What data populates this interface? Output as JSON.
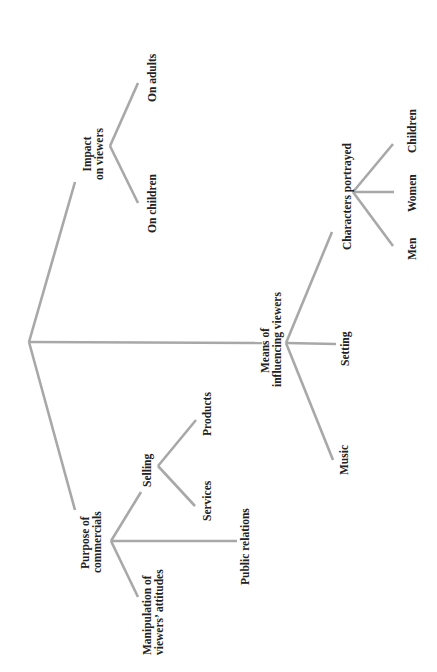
{
  "diagram": {
    "type": "tree",
    "orientation": "rotated-90-counterclockwise",
    "line_color": "#a8a8a8",
    "text_color": "#222222",
    "root": {
      "label": "",
      "children": [
        {
          "id": "impact",
          "label_lines": [
            "Impact",
            "on viewers"
          ],
          "children": [
            {
              "id": "on_children",
              "label": "On children"
            },
            {
              "id": "on_adults",
              "label": "On adults"
            }
          ]
        },
        {
          "id": "means",
          "label_lines": [
            "Means of",
            "influencing viewers"
          ],
          "children": [
            {
              "id": "music",
              "label": "Music"
            },
            {
              "id": "setting",
              "label": "Setting"
            },
            {
              "id": "characters",
              "label": "Characters portrayed",
              "children": [
                {
                  "id": "men",
                  "label": "Men"
                },
                {
                  "id": "women",
                  "label": "Women"
                },
                {
                  "id": "children",
                  "label": "Children"
                }
              ]
            }
          ]
        },
        {
          "id": "purpose",
          "label_lines": [
            "Purpose of",
            "commercials"
          ],
          "children": [
            {
              "id": "manipulation",
              "label_lines": [
                "Manipulation of",
                "viewers' attitudes"
              ]
            },
            {
              "id": "public_relations",
              "label": "Public relations"
            },
            {
              "id": "selling",
              "label": "Selling",
              "children": [
                {
                  "id": "services",
                  "label": "Services"
                },
                {
                  "id": "products",
                  "label": "Products"
                }
              ]
            }
          ]
        }
      ]
    }
  },
  "labels": {
    "impact": [
      "Impact",
      "on viewers"
    ],
    "on_children": "On children",
    "on_adults": "On adults",
    "means": [
      "Means of",
      "influencing viewers"
    ],
    "music": "Music",
    "setting": "Setting",
    "characters": "Characters portrayed",
    "men": "Men",
    "women": "Women",
    "children": "Children",
    "purpose": [
      "Purpose of",
      "commercials"
    ],
    "manipulation": [
      "Manipulation of",
      "viewers’ attitudes"
    ],
    "public_relations": "Public relations",
    "selling": "Selling",
    "services": "Services",
    "products": "Products"
  }
}
